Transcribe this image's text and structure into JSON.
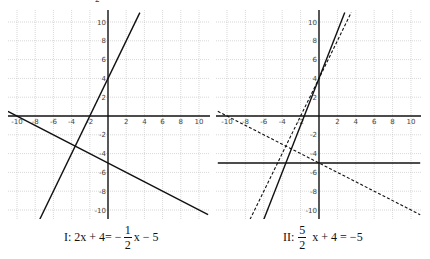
{
  "top_fragment": "2",
  "chart_data": [
    {
      "type": "line",
      "title": "I: 2x + 4 = -1/2 x - 5",
      "panel": "I",
      "xlim": [
        -11,
        11
      ],
      "ylim": [
        -11,
        11
      ],
      "x_ticks": [
        -10,
        -8,
        -6,
        -4,
        -2,
        2,
        4,
        6,
        8,
        10
      ],
      "y_ticks": [
        10,
        8,
        6,
        4,
        2,
        -2,
        -4,
        -6,
        -8,
        -10
      ],
      "grid": true,
      "series": [
        {
          "name": "y = 2x + 4",
          "style": "solid",
          "slope": 2,
          "intercept": 4,
          "x": [
            -7.5,
            3.5
          ],
          "y": [
            -11,
            11
          ]
        },
        {
          "name": "y = -1/2 x - 5",
          "style": "solid",
          "slope": -0.5,
          "intercept": -5,
          "x": [
            -11,
            11
          ],
          "y": [
            0.5,
            -10.5
          ]
        }
      ],
      "intersection": {
        "x": -3.6,
        "y": -3.2
      }
    },
    {
      "type": "line",
      "title": "II: 5/2 x + 4 = -5",
      "panel": "II",
      "xlim": [
        -11,
        11
      ],
      "ylim": [
        -11,
        11
      ],
      "x_ticks": [
        -10,
        -8,
        -6,
        -4,
        -2,
        2,
        4,
        6,
        8,
        10
      ],
      "y_ticks": [
        10,
        8,
        6,
        4,
        2,
        -2,
        -4,
        -6,
        -8,
        -10
      ],
      "grid": true,
      "series": [
        {
          "name": "y = 5/2 x + 4",
          "style": "solid",
          "slope": 2.5,
          "intercept": 4,
          "x": [
            -6,
            2.8
          ],
          "y": [
            -11,
            11
          ]
        },
        {
          "name": "y = -5",
          "style": "solid",
          "slope": 0,
          "intercept": -5,
          "x": [
            -11,
            11
          ],
          "y": [
            -5,
            -5
          ]
        },
        {
          "name": "y = 2x + 4",
          "style": "dashed",
          "slope": 2,
          "intercept": 4,
          "x": [
            -7.5,
            3.5
          ],
          "y": [
            -11,
            11
          ]
        },
        {
          "name": "y = -1/2 x - 5",
          "style": "dashed",
          "slope": -0.5,
          "intercept": -5,
          "x": [
            -11,
            11
          ],
          "y": [
            0.5,
            -10.5
          ]
        }
      ],
      "intersection": {
        "x": -3.6,
        "y": -5
      }
    }
  ],
  "captions": {
    "one": {
      "prefix": "I: 2x + 4= −",
      "num": "1",
      "den": "2",
      "suffix": "x − 5"
    },
    "two": {
      "prefix": "II:",
      "num": "5",
      "den": "2",
      "suffix": "x + 4 = −5"
    }
  }
}
